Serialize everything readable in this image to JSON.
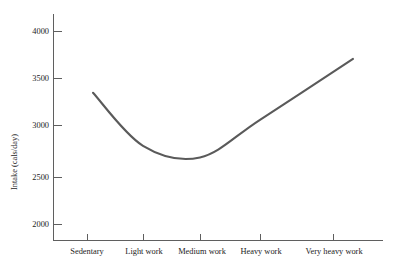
{
  "chart_data": {
    "type": "line",
    "title": "",
    "subtitle": "",
    "xlabel": "",
    "ylabel": "Intake (cals/day)",
    "categories": [
      "Sedentary",
      "Light work",
      "Medium work",
      "Heavy work",
      "Very heavy work"
    ],
    "series": [
      {
        "name": "Energy intake",
        "values": [
          3360,
          2810,
          2690,
          3080,
          3710
        ]
      }
    ],
    "x": [
      1,
      2,
      3,
      4,
      5
    ],
    "ylim": [
      1850,
      4120
    ],
    "yticks": [
      2000,
      2500,
      3000,
      3500,
      4000
    ],
    "ytick_labels": [
      "2000",
      "2500",
      "3000",
      "3500",
      "4000"
    ],
    "grid": false,
    "legend": false,
    "legend_position": "none",
    "annotations": [],
    "curve_color": "#5a5a5a",
    "axis_color": "#5f5f5f",
    "background_color": "#ffffff",
    "curve_points": [
      {
        "label": "start",
        "x": 93,
        "y": 89,
        "value": 3360
      },
      {
        "label": "light-work",
        "x": 143,
        "y": 146,
        "value": 2810
      },
      {
        "label": "minimum",
        "x": 165,
        "y": 158,
        "value": 2690
      },
      {
        "label": "heavy-work",
        "x": 260,
        "y": 117,
        "value": 3080
      },
      {
        "label": "end",
        "x": 353,
        "y": 56,
        "value": 3710
      }
    ]
  },
  "axes": {
    "y_axis_label": "Intake (cals/day)",
    "y_ticks": [
      {
        "label": "4000",
        "y": 31
      },
      {
        "label": "3500",
        "y": 78
      },
      {
        "label": "3000",
        "y": 125
      },
      {
        "label": "2500",
        "y": 177
      },
      {
        "label": "2000",
        "y": 224
      }
    ],
    "x_ticks": [
      {
        "label": "Sedentary",
        "x": 87
      },
      {
        "label": "Light work",
        "x": 143
      },
      {
        "label": "Medium work",
        "x": 200
      },
      {
        "label": "Heavy work",
        "x": 260
      },
      {
        "label": "Very heavy work",
        "x": 333
      }
    ]
  }
}
